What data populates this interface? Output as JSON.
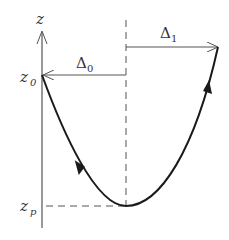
{
  "diagram": {
    "axis_label": "z",
    "labels": {
      "z0": {
        "main": "z",
        "sub": "0"
      },
      "zp": {
        "main": "z",
        "sub": "p"
      },
      "delta0": {
        "main": "Δ",
        "sub": "0"
      },
      "delta1": {
        "main": "Δ",
        "sub": "1"
      }
    },
    "colors": {
      "curve": "#1a1a1a",
      "axis": "#555555",
      "text": "#333333"
    }
  }
}
